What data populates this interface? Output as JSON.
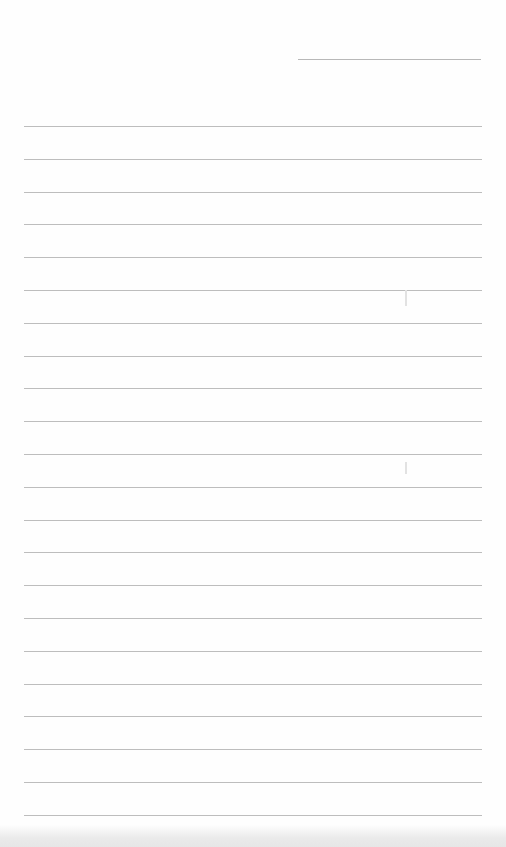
{
  "document": {
    "type": "blank lined paper",
    "header_line": {
      "left": 298,
      "top": 59,
      "width": 183
    },
    "rules": {
      "count": 22,
      "first_top": 126,
      "spacing": 32.8,
      "left": 24,
      "width": 458
    },
    "colors": {
      "paper": "#fefefe",
      "rule": "#bdbdbd",
      "scan_band": "#e6e6e6"
    },
    "text": ""
  }
}
